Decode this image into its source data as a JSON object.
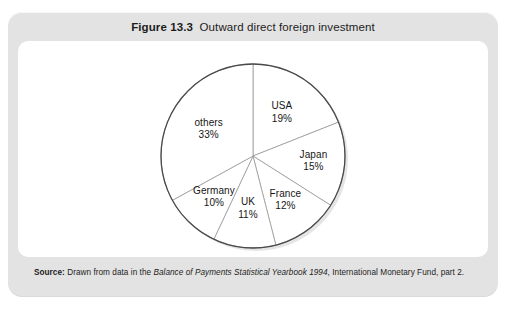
{
  "figure": {
    "number": "Figure 13.3",
    "title": "Outward direct foreign investment",
    "source_label": "Source:",
    "source_text_before": "Drawn from data in the ",
    "source_italic": "Balance of Payments Statistical Yearbook 1994",
    "source_text_after": ", International Monetary Fund, part 2."
  },
  "chart_data": {
    "type": "pie",
    "title": "Outward direct foreign investment",
    "unit": "%",
    "start_angle_deg": 0,
    "direction": "clockwise",
    "legend": "none",
    "labels_inline": true,
    "categories": [
      "USA",
      "Japan",
      "France",
      "UK",
      "Germany",
      "others"
    ],
    "values": [
      19,
      15,
      12,
      11,
      10,
      33
    ],
    "slices": [
      {
        "name": "USA",
        "value": 19,
        "label": "USA",
        "value_label": "19%"
      },
      {
        "name": "Japan",
        "value": 15,
        "label": "Japan",
        "value_label": "15%"
      },
      {
        "name": "France",
        "value": 12,
        "label": "France",
        "value_label": "12%"
      },
      {
        "name": "UK",
        "value": 11,
        "label": "UK",
        "value_label": "11%"
      },
      {
        "name": "Germany",
        "value": 10,
        "label": "Germany",
        "value_label": "10%"
      },
      {
        "name": "others",
        "value": 33,
        "label": "others",
        "value_label": "33%"
      }
    ]
  },
  "colors": {
    "frame": "#e3e3e3",
    "panel": "#ffffff",
    "pie_outline": "#4a4a4a",
    "slice_divider": "#9a9a9a",
    "text": "#161616"
  }
}
